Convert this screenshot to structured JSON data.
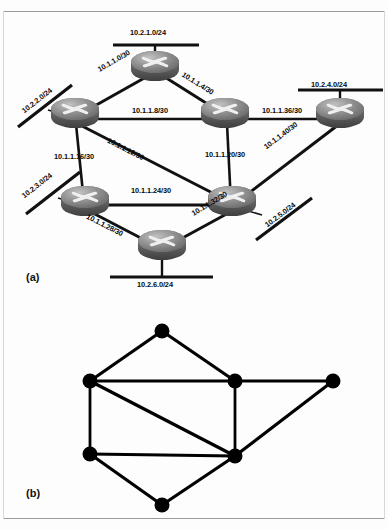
{
  "figure": {
    "captions": {
      "panel_a": "(a)",
      "panel_b": "(b)"
    }
  },
  "diagram_a": {
    "type": "network-topology",
    "routers": [
      {
        "id": "R1",
        "x": 155,
        "y": 70
      },
      {
        "id": "R2",
        "x": 75,
        "y": 117
      },
      {
        "id": "R3",
        "x": 225,
        "y": 117
      },
      {
        "id": "R4",
        "x": 340,
        "y": 117
      },
      {
        "id": "R5",
        "x": 85,
        "y": 203
      },
      {
        "id": "R6",
        "x": 232,
        "y": 205
      },
      {
        "id": "R7",
        "x": 160,
        "y": 247
      }
    ],
    "point_to_point_links": [
      {
        "label": "10.1.1.0/30",
        "from": "R2",
        "to": "R1"
      },
      {
        "label": "10.1.1.4/30",
        "from": "R1",
        "to": "R3"
      },
      {
        "label": "10.1.1.8/30",
        "from": "R2",
        "to": "R3"
      },
      {
        "label": "10.1.1.12/30",
        "from": "R2",
        "to": "R6"
      },
      {
        "label": "10.1.1.16/30",
        "from": "R2",
        "to": "R5"
      },
      {
        "label": "10.1.1.20/30",
        "from": "R3",
        "to": "R6"
      },
      {
        "label": "10.1.1.24/30",
        "from": "R5",
        "to": "R6"
      },
      {
        "label": "10.1.1.28/30",
        "from": "R5",
        "to": "R7"
      },
      {
        "label": "10.1.1.32/30",
        "from": "R7",
        "to": "R6"
      },
      {
        "label": "10.1.1.36/30",
        "from": "R3",
        "to": "R4"
      },
      {
        "label": "10.1.1.40/30",
        "from": "R6",
        "to": "R4"
      }
    ],
    "stub_networks": [
      {
        "label": "10.2.1.0/24",
        "router": "R1",
        "orientation": "horizontal-top"
      },
      {
        "label": "10.2.2.0/24",
        "router": "R2",
        "orientation": "diagonal-left"
      },
      {
        "label": "10.2.3.0/24",
        "router": "R5",
        "orientation": "diagonal-left"
      },
      {
        "label": "10.2.4.0/24",
        "router": "R4",
        "orientation": "horizontal-top"
      },
      {
        "label": "10.2.5.0/24",
        "router": "R6",
        "orientation": "diagonal-right"
      },
      {
        "label": "10.2.6.0/24",
        "router": "R7",
        "orientation": "horizontal-bottom"
      }
    ],
    "labels": {
      "l_10_1_1_0_30": "10.1.1.0/30",
      "l_10_1_1_4_30": "10.1.1.4/30",
      "l_10_1_1_8_30": "10.1.1.8/30",
      "l_10_1_1_12_30": "10.1.1.12/30",
      "l_10_1_1_16_30": "10.1.1.16/30",
      "l_10_1_1_20_30": "10.1.1.20/30",
      "l_10_1_1_24_30": "10.1.1.24/30",
      "l_10_1_1_28_30": "10.1.1.28/30",
      "l_10_1_1_32_30": "10.1.1.32/30",
      "l_10_1_1_36_30": "10.1.1.36/30",
      "l_10_1_1_40_30": "10.1.1.40/30",
      "l_10_2_1_0_24": "10.2.1.0/24",
      "l_10_2_2_0_24": "10.2.2.0/24",
      "l_10_2_3_0_24": "10.2.3.0/24",
      "l_10_2_4_0_24": "10.2.4.0/24",
      "l_10_2_5_0_24": "10.2.5.0/24",
      "l_10_2_6_0_24": "10.2.6.0/24"
    }
  },
  "diagram_b": {
    "type": "graph",
    "nodes": [
      {
        "id": "N1",
        "x": 162,
        "y": 331
      },
      {
        "id": "N2",
        "x": 90,
        "y": 381
      },
      {
        "id": "N3",
        "x": 235,
        "y": 381
      },
      {
        "id": "N4",
        "x": 333,
        "y": 381
      },
      {
        "id": "N5",
        "x": 90,
        "y": 454
      },
      {
        "id": "N6",
        "x": 235,
        "y": 456
      },
      {
        "id": "N7",
        "x": 162,
        "y": 505
      }
    ],
    "edges": [
      {
        "from": "N2",
        "to": "N1"
      },
      {
        "from": "N1",
        "to": "N3"
      },
      {
        "from": "N2",
        "to": "N3"
      },
      {
        "from": "N3",
        "to": "N4"
      },
      {
        "from": "N2",
        "to": "N5"
      },
      {
        "from": "N2",
        "to": "N6"
      },
      {
        "from": "N3",
        "to": "N6"
      },
      {
        "from": "N5",
        "to": "N6"
      },
      {
        "from": "N6",
        "to": "N4"
      },
      {
        "from": "N5",
        "to": "N7"
      },
      {
        "from": "N7",
        "to": "N6"
      }
    ]
  },
  "colors": {
    "router_top": "#9a9a9a",
    "router_body": "#6f6f6f",
    "router_dark": "#4a4a4a",
    "line": "#111111",
    "node_fill": "#000000",
    "text": "#0a0a0a"
  }
}
